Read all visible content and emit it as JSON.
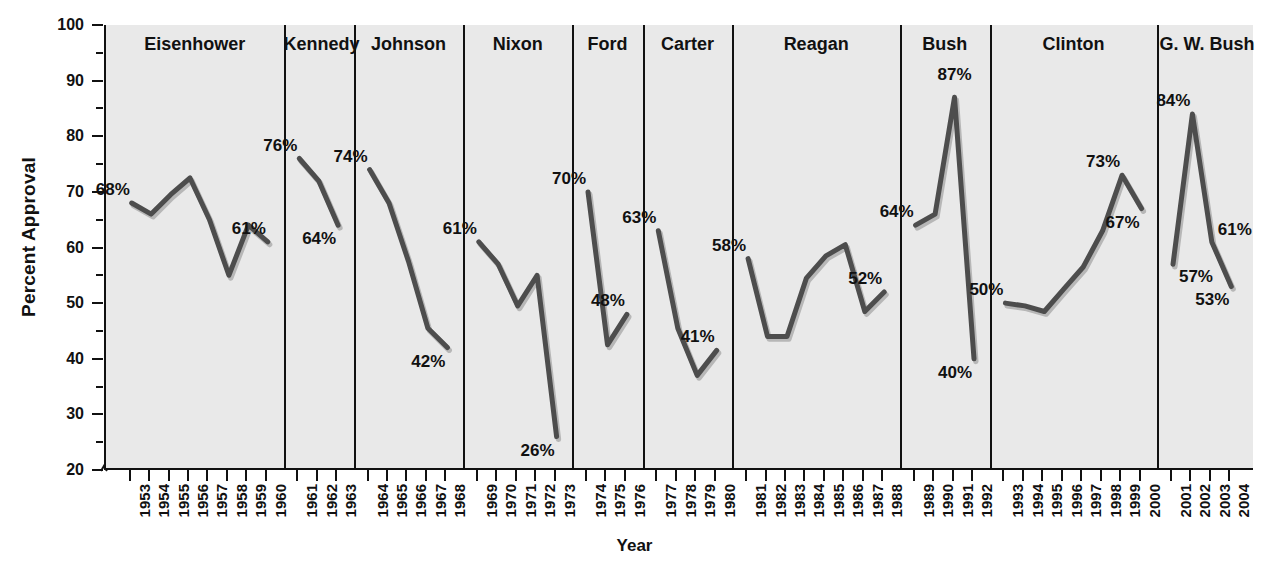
{
  "chart_data": {
    "type": "line",
    "title": "",
    "xlabel": "Year",
    "ylabel": "Percent Approval",
    "ylim": [
      20,
      100
    ],
    "ytick_step": 10,
    "yticks": [
      20,
      30,
      40,
      50,
      60,
      70,
      80,
      90,
      100
    ],
    "axis_break": true,
    "grid": false,
    "legend": "none",
    "x": [
      1953,
      1954,
      1955,
      1956,
      1957,
      1958,
      1959,
      1960,
      1961,
      1962,
      1963,
      1964,
      1965,
      1966,
      1967,
      1968,
      1969,
      1970,
      1971,
      1972,
      1973,
      1974,
      1975,
      1976,
      1977,
      1978,
      1979,
      1980,
      1981,
      1982,
      1983,
      1984,
      1985,
      1986,
      1987,
      1988,
      1989,
      1990,
      1991,
      1992,
      1993,
      1994,
      1995,
      1996,
      1997,
      1998,
      1999,
      2000,
      2001,
      2002,
      2003,
      2004
    ],
    "panels": [
      {
        "name": "Eisenhower",
        "years": [
          1953,
          1954,
          1955,
          1956,
          1957,
          1958,
          1959,
          1960
        ],
        "values": [
          68,
          66,
          69.5,
          72.5,
          65,
          55,
          64,
          61
        ],
        "labels": [
          {
            "text": "68%",
            "year": 1953,
            "value": 68,
            "position": "above-left"
          },
          {
            "text": "61%",
            "year": 1960,
            "value": 61,
            "position": "above-left"
          }
        ]
      },
      {
        "name": "Kennedy",
        "years": [
          1961,
          1962,
          1963
        ],
        "values": [
          76,
          72,
          64
        ],
        "labels": [
          {
            "text": "76%",
            "year": 1961,
            "value": 76,
            "position": "above-left"
          },
          {
            "text": "64%",
            "year": 1963,
            "value": 64,
            "position": "below-left"
          }
        ]
      },
      {
        "name": "Johnson",
        "years": [
          1964,
          1965,
          1966,
          1967,
          1968
        ],
        "values": [
          74,
          68,
          57.5,
          45.5,
          42
        ],
        "labels": [
          {
            "text": "74%",
            "year": 1964,
            "value": 74,
            "position": "above-left"
          },
          {
            "text": "42%",
            "year": 1968,
            "value": 42,
            "position": "below-left"
          }
        ]
      },
      {
        "name": "Nixon",
        "years": [
          1969,
          1970,
          1971,
          1972,
          1973
        ],
        "values": [
          61,
          57,
          49.5,
          55,
          26
        ],
        "labels": [
          {
            "text": "61%",
            "year": 1969,
            "value": 61,
            "position": "above-left"
          },
          {
            "text": "26%",
            "year": 1973,
            "value": 26,
            "position": "below-left"
          }
        ]
      },
      {
        "name": "Ford",
        "years": [
          1974,
          1975,
          1976
        ],
        "values": [
          70,
          42.5,
          48
        ],
        "labels": [
          {
            "text": "70%",
            "year": 1974,
            "value": 70,
            "position": "above-left"
          },
          {
            "text": "48%",
            "year": 1976,
            "value": 48,
            "position": "above-left"
          }
        ]
      },
      {
        "name": "Carter",
        "years": [
          1977,
          1978,
          1979,
          1980
        ],
        "values": [
          63,
          45.5,
          37,
          41.5
        ],
        "labels": [
          {
            "text": "63%",
            "year": 1977,
            "value": 63,
            "position": "above-left"
          },
          {
            "text": "41%",
            "year": 1980,
            "value": 41.5,
            "position": "above-left"
          }
        ]
      },
      {
        "name": "Reagan",
        "years": [
          1981,
          1982,
          1983,
          1984,
          1985,
          1986,
          1987,
          1988
        ],
        "values": [
          58,
          44,
          44,
          54.5,
          58.5,
          60.5,
          48.5,
          52
        ],
        "labels": [
          {
            "text": "58%",
            "year": 1981,
            "value": 58,
            "position": "above-left"
          },
          {
            "text": "52%",
            "year": 1988,
            "value": 52,
            "position": "above-left"
          }
        ]
      },
      {
        "name": "Bush",
        "years": [
          1989,
          1990,
          1991,
          1992
        ],
        "values": [
          64,
          66,
          87,
          40
        ],
        "labels": [
          {
            "text": "64%",
            "year": 1989,
            "value": 64,
            "position": "above-left"
          },
          {
            "text": "87%",
            "year": 1991,
            "value": 87,
            "position": "above"
          },
          {
            "text": "40%",
            "year": 1992,
            "value": 40,
            "position": "below-left"
          }
        ]
      },
      {
        "name": "Clinton",
        "years": [
          1993,
          1994,
          1995,
          1996,
          1997,
          1998,
          1999,
          2000
        ],
        "values": [
          50,
          49.5,
          48.5,
          52.5,
          56.5,
          63,
          73,
          67
        ],
        "labels": [
          {
            "text": "50%",
            "year": 1993,
            "value": 50,
            "position": "above-left"
          },
          {
            "text": "73%",
            "year": 1999,
            "value": 73,
            "position": "above-left"
          },
          {
            "text": "67%",
            "year": 2000,
            "value": 67,
            "position": "below-left"
          }
        ]
      },
      {
        "name": "G. W. Bush",
        "years": [
          2001,
          2002,
          2003,
          2004
        ],
        "values": [
          57,
          84,
          61,
          53
        ],
        "labels": [
          {
            "text": "84%",
            "year": 2002,
            "value": 84,
            "position": "above-left"
          },
          {
            "text": "57%",
            "year": 2001,
            "value": 57,
            "position": "below-right"
          },
          {
            "text": "61%",
            "year": 2003,
            "value": 61,
            "position": "above-right"
          },
          {
            "text": "53%",
            "year": 2004,
            "value": 53,
            "position": "below-left"
          }
        ]
      }
    ],
    "colors": {
      "line": "#4d4d4d",
      "line_shadow": "#b7b7b7",
      "panel_background": "#e9e9e9",
      "axis": "#111111",
      "page_background": "#ffffff"
    }
  }
}
